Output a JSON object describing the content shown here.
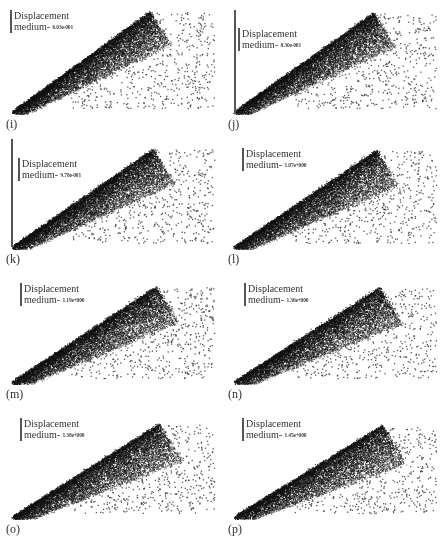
{
  "figure": {
    "legend_title": "Displacement",
    "legend_prefix": "medium-",
    "panels": [
      {
        "id": "i",
        "caption": "(i)",
        "value": "6.03e-001",
        "axis_line": false,
        "spread": 0.0
      },
      {
        "id": "j",
        "caption": "(j)",
        "value": "8.30e-001",
        "axis_line": true,
        "spread": 0.03
      },
      {
        "id": "k",
        "caption": "(k)",
        "value": "9.78e-001",
        "axis_line": true,
        "spread": 0.05
      },
      {
        "id": "l",
        "caption": "(l)",
        "value": "1.07e+000",
        "axis_line": false,
        "spread": 0.07
      },
      {
        "id": "m",
        "caption": "(m)",
        "value": "1.19e+000",
        "axis_line": false,
        "spread": 0.09
      },
      {
        "id": "n",
        "caption": "(n)",
        "value": "1.30e+000",
        "axis_line": false,
        "spread": 0.11
      },
      {
        "id": "o",
        "caption": "(o)",
        "value": "1.38e+000",
        "axis_line": false,
        "spread": 0.13
      },
      {
        "id": "p",
        "caption": "(p)",
        "value": "1.45e+000",
        "axis_line": false,
        "spread": 0.15
      }
    ]
  },
  "colors": {
    "dense": "#111111",
    "sparse": "#555555",
    "background": "#ffffff"
  }
}
